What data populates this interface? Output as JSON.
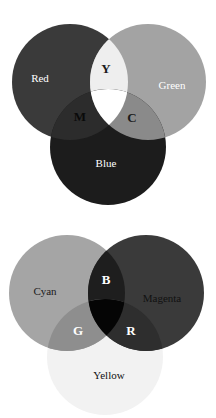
{
  "additive": {
    "title": "Additive color mixing (RGB)",
    "circles": [
      {
        "name": "Red",
        "cx": 70,
        "cy": 82,
        "r": 58,
        "fill": "#3a3a3a",
        "label_x": 40,
        "label_y": 79,
        "label_color": "#ffffff"
      },
      {
        "name": "Green",
        "cx": 148,
        "cy": 82,
        "r": 58,
        "fill": "#a3a3a3",
        "label_x": 172,
        "label_y": 86,
        "label_color": "#ffffff"
      },
      {
        "name": "Blue",
        "cx": 108,
        "cy": 147,
        "r": 58,
        "fill": "#1c1c1c",
        "label_x": 106,
        "label_y": 164,
        "label_color": "#ffffff"
      }
    ],
    "overlaps": {
      "Y": {
        "label": "Y",
        "x": 106,
        "y": 70,
        "fill": "#eeeeee",
        "color": "#1a1a1a"
      },
      "M": {
        "label": "M",
        "x": 80,
        "y": 118,
        "fill": "#2c2c2c",
        "color": "#0a0a0a"
      },
      "C": {
        "label": "C",
        "x": 132,
        "y": 119,
        "fill": "#8a8a8a",
        "color": "#1a1a1a"
      },
      "center_fill": "#ffffff"
    }
  },
  "subtractive": {
    "title": "Subtractive color mixing (CMY)",
    "circles": [
      {
        "name": "Cyan",
        "cx": 67,
        "cy": 293,
        "r": 58,
        "fill": "#a5a5a5",
        "label_x": 45,
        "label_y": 292,
        "label_color": "#1a1a1a"
      },
      {
        "name": "Magenta",
        "cx": 146,
        "cy": 293,
        "r": 58,
        "fill": "#3a3a3a",
        "label_x": 162,
        "label_y": 299,
        "label_color": "#111111"
      },
      {
        "name": "Yellow",
        "cx": 105,
        "cy": 357,
        "r": 58,
        "fill": "#f2f2f2",
        "label_x": 109,
        "label_y": 376,
        "label_color": "#111111"
      }
    ],
    "overlaps": {
      "B": {
        "label": "B",
        "x": 106,
        "y": 281,
        "fill": "#1e1e1e",
        "color": "#ffffff"
      },
      "G": {
        "label": "G",
        "x": 78,
        "y": 332,
        "fill": "#8e8e8e",
        "color": "#ffffff"
      },
      "R": {
        "label": "R",
        "x": 131,
        "y": 332,
        "fill": "#2e2e2e",
        "color": "#ffffff"
      },
      "center_fill": "#050505"
    }
  }
}
